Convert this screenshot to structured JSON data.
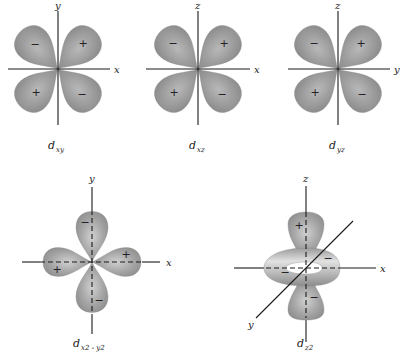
{
  "colors": {
    "lobe": "#8f8f8f",
    "lobe_highlight": "#bdbdbd",
    "axis": "#1a1a1a"
  },
  "orbitals": [
    {
      "name_main": "d",
      "name_sub": "xy",
      "h_axis": "x",
      "v_axis": "y",
      "signs": {
        "upper_left": "−",
        "upper_right": "+",
        "lower_left": "+",
        "lower_right": "−"
      }
    },
    {
      "name_main": "d",
      "name_sub": "xz",
      "h_axis": "x",
      "v_axis": "z",
      "signs": {
        "upper_left": "−",
        "upper_right": "+",
        "lower_left": "+",
        "lower_right": "−"
      }
    },
    {
      "name_main": "d",
      "name_sub": "yz",
      "h_axis": "y",
      "v_axis": "z",
      "signs": {
        "upper_left": "−",
        "upper_right": "+",
        "lower_left": "+",
        "lower_right": "−"
      }
    },
    {
      "name_main": "d",
      "name_sub": "x2 - y2",
      "h_axis": "x",
      "v_axis": "y",
      "signs": {
        "top": "−",
        "right": "+",
        "left": "+",
        "bottom": "−"
      }
    },
    {
      "name_main": "d",
      "name_sub": "z2",
      "h_axis": "x",
      "v_axis": "z",
      "d_axis": "y",
      "signs": {
        "top": "+",
        "ring_left": "−",
        "ring_right": "−",
        "bottom": "−"
      }
    }
  ]
}
